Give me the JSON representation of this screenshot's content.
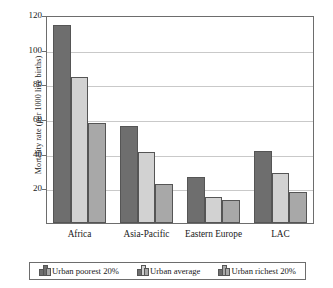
{
  "chart_data": {
    "type": "bar",
    "title": "",
    "subtitle": "",
    "xlabel": "",
    "ylabel": "Mortality rate (per 1000 live births)",
    "categories": [
      "Africa",
      "Asia-Pacific",
      "Eastern Europe",
      "LAC"
    ],
    "series": [
      {
        "name": "Urban poorest 20%",
        "color": "#6e6e6e",
        "values": [
          114,
          56,
          26.5,
          41.5
        ]
      },
      {
        "name": "Urban average",
        "color": "#d2d2d2",
        "values": [
          84,
          41,
          15,
          29
        ]
      },
      {
        "name": "Urban richest 20%",
        "color": "#a8a8a8",
        "values": [
          57.5,
          22.5,
          13,
          18
        ]
      }
    ],
    "ylim": [
      0,
      120
    ],
    "y_ticks": [
      0,
      20,
      40,
      60,
      80,
      100,
      120
    ],
    "y_tick_labels": [
      "",
      "20",
      "40",
      "60",
      "80",
      "100",
      "120"
    ],
    "grid": true,
    "legend_position": "bottom",
    "legend_entries": [
      "Urban poorest 20%",
      "Urban average",
      "Urban richest 20%"
    ],
    "legend_icon": "bar-chart-icon"
  }
}
